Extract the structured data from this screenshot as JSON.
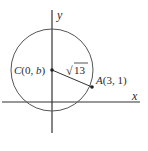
{
  "diagram": {
    "axes": {
      "x_label": "x",
      "y_label": "y"
    },
    "circle": {
      "center_label_var": "C",
      "center_label_coords": "(0, ",
      "center_label_b": "b",
      "center_label_close": ")",
      "radius_label": "13",
      "radius_label_prefix": "√"
    },
    "point": {
      "label_var": "A",
      "label_coords": "(3, 1)"
    },
    "colors": {
      "stroke": "#555555",
      "axis": "#333333",
      "text": "#2a2a2a"
    }
  }
}
